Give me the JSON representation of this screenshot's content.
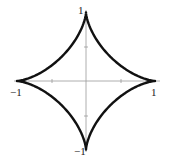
{
  "chart_data": {
    "type": "line",
    "title": "",
    "curve": "astroid x^(2/3) + y^(2/3) = 1",
    "parametric": {
      "x": "cos^3(t)",
      "y": "sin^3(t)",
      "t_range": [
        0,
        6.2832
      ]
    },
    "cusps": [
      [
        1,
        0
      ],
      [
        0,
        1
      ],
      [
        -1,
        0
      ],
      [
        0,
        -1
      ]
    ],
    "xlim": [
      -1,
      1
    ],
    "ylim": [
      -1,
      1
    ],
    "x_ticks": [
      -1,
      -0.5,
      0.5,
      1
    ],
    "y_ticks": [
      -1,
      -0.5,
      0.5,
      1
    ],
    "xlabel": "",
    "ylabel": "",
    "grid": false,
    "line_color": "#111111",
    "axis_color": "#999999"
  },
  "labels": {
    "x_neg": "−1",
    "x_pos": "1",
    "y_pos": "1",
    "y_neg": "−1"
  }
}
